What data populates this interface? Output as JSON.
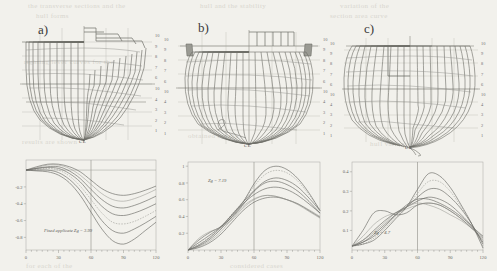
{
  "figure": {
    "type": "technical-line-figure",
    "background_color": "#f2f1ec",
    "line_color": "#6b6b6b"
  },
  "ghost_text": [
    {
      "text": "the transverse sections and the",
      "x": 28,
      "y": 2
    },
    {
      "text": "hull forms",
      "x": 36,
      "y": 12
    },
    {
      "text": "hull and the stability",
      "x": 200,
      "y": 2
    },
    {
      "text": "variation of the",
      "x": 340,
      "y": 2
    },
    {
      "text": "section area curve",
      "x": 330,
      "y": 12
    },
    {
      "text": "righting lever curves for the",
      "x": 24,
      "y": 58
    },
    {
      "text": "results are shown",
      "x": 22,
      "y": 138
    },
    {
      "text": "obtained for the",
      "x": 188,
      "y": 132
    },
    {
      "text": "hull variants",
      "x": 370,
      "y": 140
    },
    {
      "text": "for each of the",
      "x": 26,
      "y": 262
    },
    {
      "text": "considered cases",
      "x": 230,
      "y": 262
    }
  ],
  "panels": [
    {
      "id": "a",
      "label": "a)",
      "hull": {
        "centerline_label": "CL",
        "waterline_scale": [
          "10",
          "9",
          "8",
          "7",
          "6",
          "10",
          "4",
          "3",
          "2",
          "1"
        ]
      },
      "plot": {
        "ylabels": [
          "-0.2",
          "-0.4",
          "-0.6",
          "-0.8"
        ],
        "yvalues": [
          -0.2,
          -0.4,
          -0.6,
          -0.8
        ],
        "xlabels": [
          "0",
          "30",
          "60",
          "90",
          "120"
        ],
        "xvalues": [
          0,
          30,
          60,
          90,
          120
        ],
        "annotation": "Fixed applicate  Zg = 3.99"
      }
    },
    {
      "id": "b",
      "label": "b)",
      "hull": {
        "centerline_label": "CL",
        "waterline_scale": [
          "10",
          "9",
          "8",
          "7",
          "6",
          "10",
          "4",
          "3",
          "2",
          "1"
        ]
      },
      "plot": {
        "ylabels": [
          "1",
          "0.8",
          "0.6",
          "0.4",
          "0.2"
        ],
        "yvalues": [
          1,
          0.8,
          0.6,
          0.4,
          0.2
        ],
        "xlabels": [
          "0",
          "30",
          "60",
          "90",
          "120"
        ],
        "xvalues": [
          0,
          30,
          60,
          90,
          120
        ],
        "annotation": "Zg = 7.19"
      }
    },
    {
      "id": "c",
      "label": "c)",
      "hull": {
        "centerline_label": "CL",
        "waterline_scale": [
          "10",
          "9",
          "8",
          "7",
          "6",
          "10",
          "4",
          "3",
          "2",
          "1"
        ]
      },
      "plot": {
        "ylabels": [
          "0.4",
          "0.3",
          "0.2",
          "0.1"
        ],
        "yvalues": [
          0.4,
          0.3,
          0.2,
          0.1
        ],
        "xlabels": [
          "0",
          "30",
          "60",
          "90",
          "120"
        ],
        "xvalues": [
          0,
          30,
          60,
          90,
          120
        ],
        "annotation": "Zg = 4.7"
      }
    }
  ],
  "chart_data": [
    {
      "type": "line",
      "panel": "a",
      "title": "",
      "xlabel": "",
      "ylabel": "",
      "xlim": [
        0,
        120
      ],
      "ylim": [
        -0.95,
        0.12
      ],
      "grid": true,
      "annotation": "Fixed applicate  Zg = 3.99",
      "x": [
        0,
        10,
        20,
        30,
        40,
        50,
        60,
        70,
        80,
        90,
        100,
        110,
        120
      ],
      "series": [
        {
          "name": "variant 1",
          "values": [
            0.0,
            0.04,
            0.07,
            0.07,
            0.04,
            -0.02,
            -0.12,
            -0.22,
            -0.28,
            -0.3,
            -0.28,
            -0.24,
            -0.19
          ]
        },
        {
          "name": "variant 2",
          "values": [
            0.0,
            0.03,
            0.06,
            0.06,
            0.02,
            -0.06,
            -0.17,
            -0.28,
            -0.35,
            -0.37,
            -0.34,
            -0.29,
            -0.23
          ]
        },
        {
          "name": "variant 3",
          "values": [
            0.0,
            0.02,
            0.04,
            0.04,
            -0.01,
            -0.1,
            -0.23,
            -0.35,
            -0.43,
            -0.45,
            -0.42,
            -0.37,
            -0.31
          ]
        },
        {
          "name": "variant 4",
          "values": [
            0.0,
            0.02,
            0.03,
            0.02,
            -0.04,
            -0.14,
            -0.29,
            -0.43,
            -0.52,
            -0.54,
            -0.51,
            -0.46,
            -0.4
          ]
        },
        {
          "name": "variant 5",
          "values": [
            0.0,
            0.01,
            0.02,
            0.0,
            -0.07,
            -0.19,
            -0.35,
            -0.51,
            -0.62,
            -0.64,
            -0.61,
            -0.55,
            -0.48
          ]
        },
        {
          "name": "variant 6",
          "values": [
            0.0,
            0.0,
            0.0,
            -0.03,
            -0.11,
            -0.24,
            -0.42,
            -0.6,
            -0.72,
            -0.75,
            -0.7,
            -0.63,
            -0.55
          ]
        },
        {
          "name": "variant 7",
          "values": [
            0.0,
            -0.01,
            -0.02,
            -0.06,
            -0.15,
            -0.3,
            -0.5,
            -0.7,
            -0.84,
            -0.88,
            -0.82,
            -0.72,
            -0.62
          ]
        }
      ]
    },
    {
      "type": "line",
      "panel": "b",
      "title": "",
      "xlabel": "",
      "ylabel": "",
      "xlim": [
        0,
        120
      ],
      "ylim": [
        0,
        1.05
      ],
      "grid": true,
      "annotation": "Zg = 7.19",
      "x": [
        0,
        10,
        20,
        30,
        40,
        50,
        60,
        70,
        80,
        90,
        100,
        110,
        120
      ],
      "series": [
        {
          "name": "variant 1",
          "values": [
            0.0,
            0.03,
            0.09,
            0.19,
            0.33,
            0.47,
            0.57,
            0.62,
            0.63,
            0.6,
            0.55,
            0.47,
            0.39
          ]
        },
        {
          "name": "variant 2",
          "values": [
            0.0,
            0.04,
            0.11,
            0.22,
            0.37,
            0.52,
            0.61,
            0.65,
            0.64,
            0.6,
            0.54,
            0.46,
            0.38
          ]
        },
        {
          "name": "variant 3",
          "values": [
            0.0,
            0.05,
            0.13,
            0.25,
            0.4,
            0.55,
            0.66,
            0.73,
            0.75,
            0.72,
            0.65,
            0.55,
            0.44
          ]
        },
        {
          "name": "variant 4",
          "values": [
            0.0,
            0.06,
            0.15,
            0.27,
            0.42,
            0.57,
            0.71,
            0.82,
            0.86,
            0.83,
            0.75,
            0.62,
            0.47
          ]
        },
        {
          "name": "variant 5",
          "values": [
            0.0,
            0.07,
            0.16,
            0.28,
            0.43,
            0.58,
            0.76,
            0.9,
            0.95,
            0.92,
            0.82,
            0.66,
            0.48
          ]
        },
        {
          "name": "variant 6",
          "values": [
            0.0,
            0.09,
            0.18,
            0.28,
            0.42,
            0.57,
            0.79,
            0.95,
            1.0,
            0.96,
            0.85,
            0.68,
            0.47
          ]
        },
        {
          "name": "variant 7",
          "values": [
            0.0,
            0.12,
            0.21,
            0.28,
            0.39,
            0.54,
            0.7,
            0.8,
            0.82,
            0.78,
            0.7,
            0.58,
            0.44
          ]
        },
        {
          "name": "variant 8",
          "values": [
            0.0,
            0.14,
            0.22,
            0.27,
            0.36,
            0.5,
            0.6,
            0.65,
            0.64,
            0.6,
            0.55,
            0.48,
            0.4
          ]
        }
      ]
    },
    {
      "type": "line",
      "panel": "c",
      "title": "",
      "xlabel": "",
      "ylabel": "",
      "xlim": [
        0,
        120
      ],
      "ylim": [
        0,
        0.45
      ],
      "grid": true,
      "annotation": "Zg = 4.7",
      "x": [
        0,
        10,
        20,
        30,
        40,
        50,
        60,
        70,
        80,
        90,
        100,
        110,
        120
      ],
      "series": [
        {
          "name": "variant 1",
          "values": [
            0.02,
            0.1,
            0.19,
            0.2,
            0.18,
            0.19,
            0.23,
            0.24,
            0.23,
            0.2,
            0.16,
            0.11,
            0.06
          ]
        },
        {
          "name": "variant 2",
          "values": [
            0.02,
            0.07,
            0.13,
            0.17,
            0.19,
            0.21,
            0.23,
            0.24,
            0.23,
            0.2,
            0.16,
            0.11,
            0.05
          ]
        },
        {
          "name": "variant 3",
          "values": [
            0.02,
            0.05,
            0.1,
            0.15,
            0.19,
            0.22,
            0.25,
            0.27,
            0.26,
            0.23,
            0.18,
            0.12,
            0.04
          ]
        },
        {
          "name": "variant 4",
          "values": [
            0.02,
            0.04,
            0.08,
            0.13,
            0.18,
            0.22,
            0.27,
            0.31,
            0.31,
            0.27,
            0.21,
            0.13,
            0.03
          ]
        },
        {
          "name": "variant 5",
          "values": [
            0.02,
            0.03,
            0.06,
            0.11,
            0.17,
            0.22,
            0.29,
            0.35,
            0.35,
            0.3,
            0.22,
            0.13,
            0.02
          ]
        },
        {
          "name": "variant 6",
          "values": [
            0.02,
            0.03,
            0.05,
            0.1,
            0.16,
            0.22,
            0.31,
            0.39,
            0.38,
            0.32,
            0.23,
            0.13,
            0.01
          ]
        },
        {
          "name": "variant 7",
          "values": [
            0.02,
            0.04,
            0.07,
            0.12,
            0.18,
            0.23,
            0.26,
            0.26,
            0.24,
            0.21,
            0.17,
            0.12,
            0.07
          ]
        },
        {
          "name": "variant 8",
          "values": [
            0.02,
            0.05,
            0.09,
            0.14,
            0.19,
            0.22,
            0.24,
            0.23,
            0.21,
            0.18,
            0.15,
            0.11,
            0.07
          ]
        }
      ]
    }
  ]
}
